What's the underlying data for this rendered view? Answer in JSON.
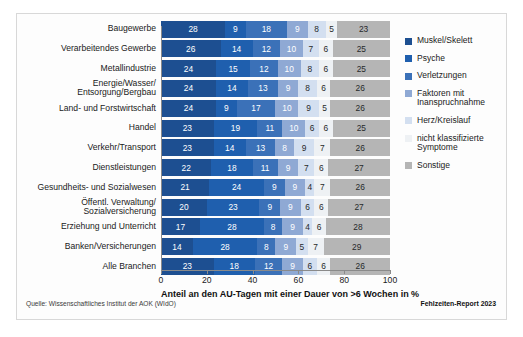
{
  "chart_data": {
    "type": "bar",
    "orientation": "horizontal",
    "stacked": true,
    "title": "",
    "xlabel": "Anteil an den AU-Tagen mit einer Dauer von >6 Wochen in %",
    "ylabel": "",
    "xlim": [
      0,
      100
    ],
    "xticks": [
      0,
      20,
      40,
      60,
      80,
      100
    ],
    "grid": false,
    "legend_position": "right",
    "categories": [
      "Baugewerbe",
      "Verarbeitendes Gewerbe",
      "Metallindustrie",
      "Energie/Wasser/\nEntsorgung/Bergbau",
      "Land- und Forstwirtschaft",
      "Handel",
      "Verkehr/Transport",
      "Dienstleistungen",
      "Gesundheits- und Sozialwesen",
      "Öffentl. Verwaltung/\nSozialversicherung",
      "Erziehung und Unterricht",
      "Banken/Versicherungen",
      "Alle Branchen"
    ],
    "series": [
      {
        "name": "Muskel/Skelett",
        "color": "#1d4f91",
        "values": [
          28,
          26,
          24,
          24,
          24,
          23,
          23,
          22,
          21,
          20,
          17,
          14,
          23
        ]
      },
      {
        "name": "Psyche",
        "color": "#1f5fae",
        "values": [
          9,
          14,
          15,
          14,
          9,
          19,
          14,
          18,
          24,
          23,
          28,
          28,
          18
        ]
      },
      {
        "name": "Verletzungen",
        "color": "#3b71b8",
        "values": [
          18,
          12,
          12,
          13,
          17,
          11,
          13,
          11,
          9,
          9,
          8,
          8,
          12
        ]
      },
      {
        "name": "Faktoren mit\nInanspruchnahme",
        "color": "#8fa9d4",
        "values": [
          9,
          10,
          10,
          9,
          10,
          10,
          8,
          9,
          9,
          9,
          9,
          9,
          9
        ]
      },
      {
        "name": "Herz/Kreislauf",
        "color": "#d3dff0",
        "values": [
          8,
          7,
          8,
          8,
          9,
          6,
          9,
          7,
          4,
          6,
          4,
          5,
          6
        ]
      },
      {
        "name": "nicht klassifizierte\nSymptome",
        "color": "#eef1f4",
        "values": [
          5,
          6,
          6,
          6,
          5,
          6,
          7,
          6,
          7,
          6,
          6,
          7,
          6
        ]
      },
      {
        "name": "Sonstige",
        "color": "#b5b5b5",
        "values": [
          23,
          25,
          25,
          26,
          26,
          25,
          26,
          27,
          26,
          27,
          28,
          29,
          26
        ]
      }
    ]
  },
  "footer": {
    "source": "Quelle: Wissenschaftliches Institut der AOK (WIdO)",
    "report": "Fehlzeiten-Report 2023"
  }
}
